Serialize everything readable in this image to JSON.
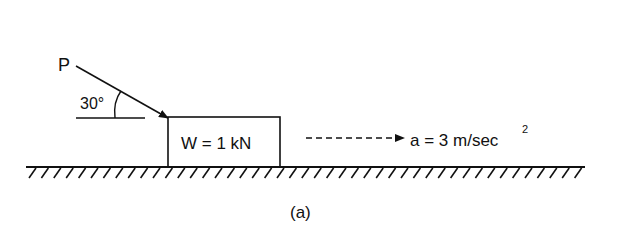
{
  "figure": {
    "caption": "(a)",
    "force_label": "P",
    "angle_label": "30°",
    "block_label": "W = 1 kN",
    "acceleration_label": "a = 3 m/sec",
    "acceleration_exponent": "2"
  },
  "colors": {
    "ink": "#111111",
    "background": "#ffffff"
  }
}
